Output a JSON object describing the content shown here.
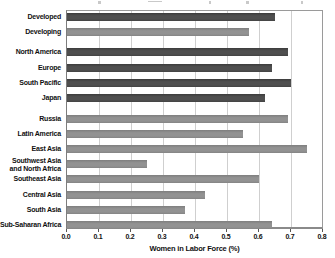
{
  "figure": {
    "axis_title": "Women in Labor Force (%)",
    "tick_labels": [
      "0.0",
      "0.1",
      "0.2",
      "0.3",
      "0.4",
      "0.5",
      "0.6",
      "0.7",
      "0.8"
    ]
  },
  "chart_data": {
    "type": "bar",
    "orientation": "horizontal",
    "title": "",
    "xlabel": "Women in Labor Force (%)",
    "ylabel": "",
    "xlim": [
      0.0,
      0.8
    ],
    "xticks": [
      0.0,
      0.1,
      0.2,
      0.3,
      0.4,
      0.5,
      0.6,
      0.7,
      0.8
    ],
    "grid": true,
    "legend": "none",
    "colors": {
      "dark": "#4f4f4f",
      "light": "#929292"
    },
    "bars": [
      {
        "label": "Developed",
        "value": 0.65,
        "shade": "dark",
        "group": 0
      },
      {
        "label": "Developing",
        "value": 0.57,
        "shade": "light",
        "group": 0
      },
      {
        "label": "North America",
        "value": 0.69,
        "shade": "dark",
        "group": 1
      },
      {
        "label": "Europe",
        "value": 0.64,
        "shade": "dark",
        "group": 1
      },
      {
        "label": "South Pacific",
        "value": 0.7,
        "shade": "dark",
        "group": 1
      },
      {
        "label": "Japan",
        "value": 0.62,
        "shade": "dark",
        "group": 1
      },
      {
        "label": "Russia",
        "value": 0.69,
        "shade": "light",
        "group": 2
      },
      {
        "label": "Latin America",
        "value": 0.55,
        "shade": "light",
        "group": 2
      },
      {
        "label": "East Asia",
        "value": 0.75,
        "shade": "light",
        "group": 2
      },
      {
        "label": "Southwest Asia and North Africa",
        "label_lines": [
          "Southwest Asia",
          "and North Africa"
        ],
        "value": 0.25,
        "shade": "light",
        "group": 2
      },
      {
        "label": "Southeast Asia",
        "value": 0.6,
        "shade": "light",
        "group": 2
      },
      {
        "label": "Central Asia",
        "value": 0.43,
        "shade": "light",
        "group": 2
      },
      {
        "label": "South Asia",
        "value": 0.37,
        "shade": "light",
        "group": 2
      },
      {
        "label": "Sub-Saharan Africa",
        "value": 0.64,
        "shade": "light",
        "group": 2
      }
    ]
  }
}
